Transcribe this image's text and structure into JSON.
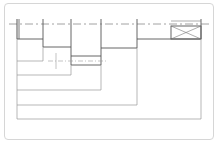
{
  "diagram": {
    "type": "stepped-shaft-drawing",
    "colors": {
      "frame": "#d6d6d6",
      "profile": "#555555",
      "dimension": "#9a9a9a",
      "centerline": "#8a8a8a"
    },
    "centerline_y": 24,
    "steps": [
      {
        "x1": 17,
        "x2": 43,
        "y": 39
      },
      {
        "x1": 43,
        "x2": 71,
        "y": 47
      },
      {
        "x1": 71,
        "x2": 101,
        "y": 56
      },
      {
        "x1": 101,
        "x2": 137,
        "y": 48
      },
      {
        "x1": 137,
        "x2": 201,
        "y": 39
      }
    ],
    "dimension_lines": [
      {
        "x_end": 43,
        "y": 61
      },
      {
        "x_end": 71,
        "y": 75
      },
      {
        "x_end": 101,
        "y": 90
      },
      {
        "x_end": 137,
        "y": 105
      },
      {
        "x_end": 201,
        "y": 119
      }
    ],
    "end_box": {
      "x": 171,
      "y": 26,
      "w": 30,
      "h": 13,
      "crossed": true
    }
  }
}
